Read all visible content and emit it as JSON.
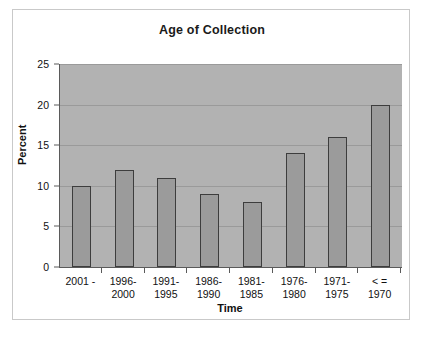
{
  "chart_data": {
    "type": "bar",
    "title": "Age of Collection",
    "xlabel": "Time",
    "ylabel": "Percent",
    "categories": [
      "2001 -",
      "1996-\n2000",
      "1991-\n1995",
      "1986-\n1990",
      "1981-\n1985",
      "1976-\n1980",
      "1971-\n1975",
      "< =\n1970"
    ],
    "values": [
      10,
      12,
      11,
      9,
      8,
      14,
      16,
      20
    ],
    "ylim": [
      0,
      25
    ],
    "yticks": [
      0,
      5,
      10,
      15,
      20,
      25
    ],
    "ytick_labels": [
      "0",
      "5",
      "10",
      "15",
      "20",
      "25"
    ],
    "grid": true,
    "legend": "none",
    "colors": {
      "plot_background": "#b2b2b2",
      "bar_fill": "#9b9b9b",
      "bar_border": "#3d3d3d",
      "gridline": "#9a9a9a",
      "axis": "#5a5a5a",
      "frame_border": "#c9c9c9",
      "text": "#111111",
      "page_background": "#ffffff"
    }
  }
}
